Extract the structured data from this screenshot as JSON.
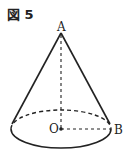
{
  "figure": {
    "label": "図 5",
    "points": {
      "A": "A",
      "O": "O",
      "B": "B"
    },
    "shape": "cone",
    "stroke_color": "#222222"
  }
}
